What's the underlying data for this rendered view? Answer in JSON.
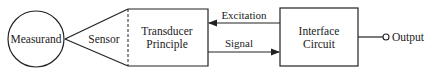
{
  "diagram": {
    "nodes": {
      "measurand": {
        "label": "Measurand"
      },
      "sensor": {
        "label": "Sensor"
      },
      "transducer": {
        "line1": "Transducer",
        "line2": "Principle"
      },
      "interface": {
        "line1": "Interface",
        "line2": "Circuit"
      },
      "output": {
        "label": "Output"
      }
    },
    "edges": {
      "excitation": {
        "label": "Excitation",
        "from": "interface",
        "to": "transducer"
      },
      "signal": {
        "label": "Signal",
        "from": "transducer",
        "to": "interface"
      }
    },
    "colors": {
      "stroke": "#222222",
      "background": "#ffffff"
    }
  }
}
